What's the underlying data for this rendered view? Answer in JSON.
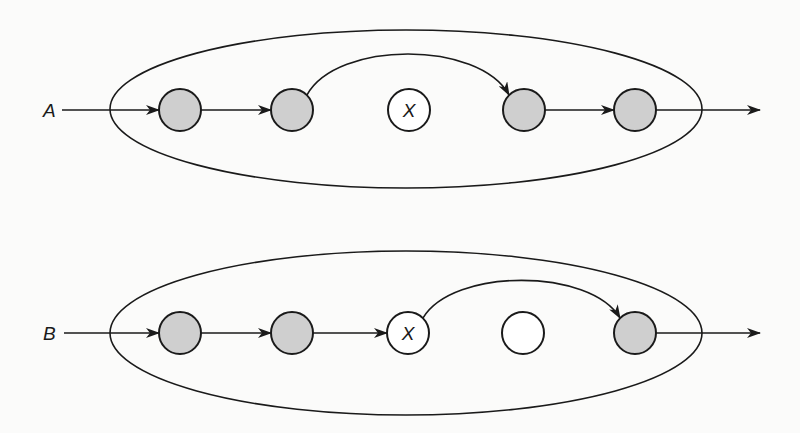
{
  "diagrams": [
    {
      "id": "A",
      "label": "A",
      "row_y": 110,
      "label_x": 43,
      "input_start_x": 62,
      "output_end_x": 760,
      "ellipse": {
        "cx": 406,
        "cy": 109,
        "rx": 296,
        "ry": 79
      },
      "nodes": [
        {
          "x": 180,
          "type": "shaded",
          "text": ""
        },
        {
          "x": 292,
          "type": "shaded",
          "text": ""
        },
        {
          "x": 409,
          "type": "white",
          "text": "X"
        },
        {
          "x": 524,
          "type": "shaded",
          "text": ""
        },
        {
          "x": 635,
          "type": "shaded",
          "text": ""
        }
      ],
      "straight_edges": [
        [
          0,
          1
        ],
        [
          3,
          4
        ]
      ],
      "curved_edges": [
        {
          "from": 1,
          "to": 3,
          "peak_y": 62
        }
      ]
    },
    {
      "id": "B",
      "label": "B",
      "row_y": 333,
      "label_x": 43,
      "input_start_x": 64,
      "output_end_x": 760,
      "ellipse": {
        "cx": 406,
        "cy": 333,
        "rx": 296,
        "ry": 82
      },
      "nodes": [
        {
          "x": 180,
          "type": "shaded",
          "text": ""
        },
        {
          "x": 292,
          "type": "shaded",
          "text": ""
        },
        {
          "x": 408,
          "type": "white",
          "text": "X"
        },
        {
          "x": 523,
          "type": "white",
          "text": ""
        },
        {
          "x": 635,
          "type": "shaded",
          "text": ""
        }
      ],
      "straight_edges": [
        [
          0,
          1
        ],
        [
          1,
          2
        ]
      ],
      "curved_edges": [
        {
          "from": 2,
          "to": 4,
          "peak_y": 288
        }
      ]
    }
  ],
  "style": {
    "node_radius": 21,
    "shaded_fill": "#cfcfcf",
    "white_fill": "#ffffff",
    "stroke": "#1a1a1a",
    "background": "#fbfbfa"
  }
}
